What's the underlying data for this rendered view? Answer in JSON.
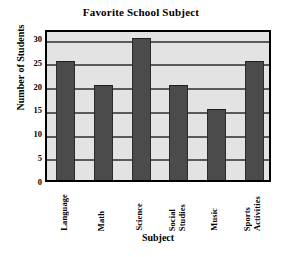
{
  "chart_data": {
    "type": "bar",
    "title": "Favorite School Subject",
    "xlabel": "Subject",
    "ylabel": "Number of Students",
    "categories": [
      "Language",
      "Math",
      "Science",
      "Social Studies",
      "Music",
      "Sports Activities"
    ],
    "category_lines": [
      [
        "Language"
      ],
      [
        "Math"
      ],
      [
        "Science"
      ],
      [
        "Social",
        "Studies"
      ],
      [
        "Music"
      ],
      [
        "Sports",
        "Activities"
      ]
    ],
    "values": [
      25,
      20,
      30,
      20,
      15,
      25
    ],
    "ylim": [
      0,
      32
    ],
    "yticks": [
      0,
      5,
      10,
      15,
      20,
      25,
      30
    ],
    "ytick_labels": [
      "0",
      "5",
      "10",
      "15",
      "20",
      "25",
      "30"
    ],
    "grid": true,
    "legend": "none",
    "colors": {
      "bar_fill": "#4b4b4b",
      "plot_background": "#e3e3e3",
      "gridline": "#5a5a5a",
      "axis_border": "#000000",
      "text": "#000000",
      "page_background": "#ffffff"
    }
  }
}
